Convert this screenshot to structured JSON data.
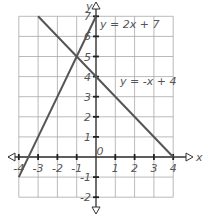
{
  "chart_data": {
    "type": "line",
    "title": "",
    "xlabel": "x",
    "ylabel": "y",
    "xlim": [
      -4,
      4
    ],
    "ylim": [
      -2,
      7
    ],
    "grid": true,
    "x_ticks": [
      "-4",
      "-3",
      "-2",
      "-1",
      "0",
      "1",
      "2",
      "3",
      "4"
    ],
    "y_ticks": [
      "-2",
      "-1",
      "1",
      "2",
      "3",
      "4",
      "5",
      "6",
      "7"
    ],
    "series": [
      {
        "name": "y = 2x + 7",
        "x": [
          -4,
          0
        ],
        "y": [
          -1,
          7
        ]
      },
      {
        "name": "y = -x + 4",
        "x": [
          -3,
          4
        ],
        "y": [
          7,
          0
        ]
      }
    ],
    "annotations": [
      {
        "text": "y = 2x + 7",
        "position": "near top, right of y-axis"
      },
      {
        "text": "y = -x + 4",
        "position": "right of y-axis near y=3.5"
      }
    ],
    "intersection": {
      "x": -1,
      "y": 5
    }
  },
  "labels": {
    "x_axis": "x",
    "y_axis": "y",
    "origin": "0",
    "eq1": "y = 2x + 7",
    "eq2": "y = -x + 4"
  }
}
